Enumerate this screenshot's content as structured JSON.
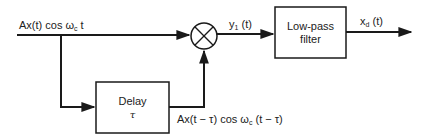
{
  "diagram": {
    "type": "block-diagram",
    "input": {
      "signal_main": "Ax(t) cos ω",
      "signal_sub": "c",
      "signal_tail": "t"
    },
    "multiplier": {
      "symbol": "⊗"
    },
    "multiplier_output": {
      "label_main": "y",
      "label_sub": "1",
      "label_tail": " (t)"
    },
    "lowpass_filter": {
      "line1": "Low-pass",
      "line2": "filter"
    },
    "output": {
      "label_main": "x",
      "label_sub": "d",
      "label_tail": " (t)"
    },
    "delay": {
      "line1": "Delay",
      "line2": "τ"
    },
    "delayed_signal": {
      "part1": "Ax(t − τ) cos ω",
      "sub": "c",
      "part2": "(t − τ)"
    }
  },
  "colors": {
    "line": "#1a1a1a",
    "background": "#ffffff"
  }
}
